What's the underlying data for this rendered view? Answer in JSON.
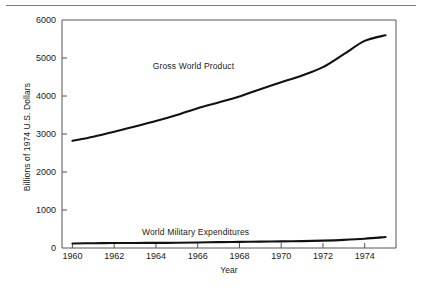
{
  "figure": {
    "divider_name": "top-divider-rule"
  },
  "chart_data": {
    "type": "line",
    "title": "",
    "xlabel": "Year",
    "ylabel": "Billions of 1974 U.S. Dollars",
    "xlim": [
      1959.5,
      1975.5
    ],
    "ylim": [
      0,
      6000
    ],
    "xticks": [
      1960,
      1962,
      1964,
      1966,
      1968,
      1970,
      1972,
      1974
    ],
    "xtick_labels": [
      "1960",
      "1962",
      "1964",
      "1966",
      "1968",
      "1970",
      "1972",
      "1974"
    ],
    "yticks": [
      0,
      1000,
      2000,
      3000,
      4000,
      5000,
      6000
    ],
    "ytick_labels": [
      "0",
      "1000",
      "2000",
      "3000",
      "4000",
      "5000",
      "6000"
    ],
    "grid": false,
    "legend_position": "inline-annotation",
    "line_color": "#111111",
    "frame_color": "#555555",
    "x": [
      1960,
      1961,
      1962,
      1963,
      1964,
      1965,
      1966,
      1967,
      1968,
      1969,
      1970,
      1971,
      1972,
      1973,
      1974,
      1975
    ],
    "series": [
      {
        "name": "Gross World Product",
        "label_text": "Gross World Product",
        "values": [
          2820,
          2930,
          3060,
          3200,
          3340,
          3500,
          3680,
          3830,
          3990,
          4180,
          4360,
          4540,
          4760,
          5100,
          5450,
          5600
        ]
      },
      {
        "name": "World Military Expenditures",
        "label_text": "World Military Expenditures",
        "values": [
          120,
          125,
          130,
          133,
          135,
          138,
          145,
          155,
          162,
          168,
          175,
          182,
          195,
          215,
          245,
          290
        ]
      }
    ],
    "annotations": [
      {
        "text": "Gross World Product",
        "x": 1965.8,
        "y": 4790
      },
      {
        "text": "World Military Expenditures",
        "x": 1965.9,
        "y": 420
      }
    ]
  }
}
